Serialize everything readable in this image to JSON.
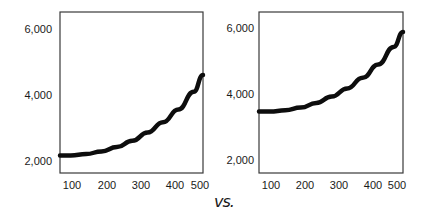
{
  "chart_data": [
    {
      "type": "line",
      "title": "",
      "xlabel": "",
      "ylabel": "",
      "x_ticks": [
        "100",
        "200",
        "300",
        "400",
        "500"
      ],
      "y_ticks": [
        "2,000",
        "4,000",
        "6,000"
      ],
      "xlim": [
        65,
        530
      ],
      "ylim": [
        1650,
        6500
      ],
      "grid": false,
      "series": [
        {
          "name": "curve",
          "x": [
            65,
            100,
            150,
            200,
            250,
            300,
            350,
            400,
            450,
            500,
            530
          ],
          "y": [
            2180,
            2180,
            2220,
            2300,
            2430,
            2620,
            2870,
            3180,
            3560,
            4100,
            4600
          ]
        }
      ]
    },
    {
      "type": "line",
      "title": "",
      "xlabel": "",
      "ylabel": "",
      "x_ticks": [
        "100",
        "200",
        "300",
        "400",
        "500"
      ],
      "y_ticks": [
        "2,000",
        "4,000",
        "6,000"
      ],
      "xlim": [
        65,
        530
      ],
      "ylim": [
        1650,
        6500
      ],
      "grid": false,
      "series": [
        {
          "name": "curve",
          "x": [
            65,
            100,
            150,
            200,
            250,
            300,
            350,
            400,
            450,
            500,
            530
          ],
          "y": [
            3500,
            3500,
            3540,
            3620,
            3760,
            3950,
            4200,
            4520,
            4920,
            5450,
            5900
          ]
        }
      ]
    }
  ],
  "separator_text": "vs.",
  "left": {
    "y_ticks": [
      "6,000",
      "4,000",
      "2,000"
    ],
    "x_ticks": [
      "100",
      "200",
      "300",
      "400",
      "500"
    ]
  },
  "right": {
    "y_ticks": [
      "6,000",
      "4,000",
      "2,000"
    ],
    "x_ticks": [
      "100",
      "200",
      "300",
      "400",
      "500"
    ]
  },
  "colors": {
    "line": "#0d0d0d",
    "axis": "#3a3a3a"
  }
}
